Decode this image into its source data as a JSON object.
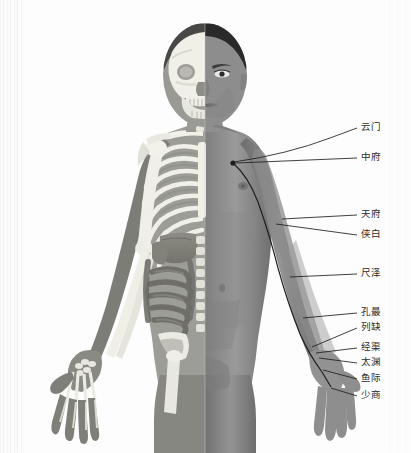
{
  "figure": {
    "width": 411,
    "height": 453,
    "background_color": "#fdfdfd",
    "line_color": "#1f1f1f",
    "label_color": "#2b2b2b",
    "skin_color": "#8e8e8e",
    "bone_color": "#f0efe9"
  },
  "meridian": {
    "name": "手太阴肺经",
    "point_count": 11
  },
  "acupoints": [
    {
      "id": "LU2",
      "label": "云门",
      "code": "LU-2",
      "label_x": 362,
      "label_y": 126,
      "anchor_x": 233,
      "anchor_y": 163,
      "leader": "curve"
    },
    {
      "id": "LU1",
      "label": "中府",
      "code": "LU-1",
      "label_x": 362,
      "label_y": 156,
      "anchor_x": 233,
      "anchor_y": 163,
      "leader": "straight"
    },
    {
      "id": "LU3",
      "label": "天府",
      "code": "LU-3",
      "label_x": 362,
      "label_y": 213,
      "anchor_x": 282,
      "anchor_y": 219,
      "leader": "straight"
    },
    {
      "id": "LU4",
      "label": "侠白",
      "code": "LU-4",
      "label_x": 362,
      "label_y": 233,
      "anchor_x": 279,
      "anchor_y": 228,
      "leader": "straight"
    },
    {
      "id": "LU5",
      "label": "尺泽",
      "code": "LU-5",
      "label_x": 362,
      "label_y": 272,
      "anchor_x": 292,
      "anchor_y": 277,
      "leader": "straight"
    },
    {
      "id": "LU6",
      "label": "孔最",
      "code": "LU-6",
      "label_x": 362,
      "label_y": 311,
      "anchor_x": 305,
      "anchor_y": 318,
      "leader": "straight"
    },
    {
      "id": "LU7",
      "label": "列缺",
      "code": "LU-7",
      "label_x": 362,
      "label_y": 326,
      "anchor_x": 314,
      "anchor_y": 348,
      "leader": "straight"
    },
    {
      "id": "LU8",
      "label": "经渠",
      "code": "LU-8",
      "label_x": 362,
      "label_y": 346,
      "anchor_x": 317,
      "anchor_y": 353,
      "leader": "straight"
    },
    {
      "id": "LU9",
      "label": "太渊",
      "code": "LU-9",
      "label_x": 362,
      "label_y": 361,
      "anchor_x": 320,
      "anchor_y": 358,
      "leader": "straight"
    },
    {
      "id": "LU10",
      "label": "鱼际",
      "code": "LU-10",
      "label_x": 362,
      "label_y": 377,
      "anchor_x": 324,
      "anchor_y": 370,
      "leader": "straight"
    },
    {
      "id": "LU11",
      "label": "少商",
      "code": "LU-11",
      "label_x": 362,
      "label_y": 394,
      "anchor_x": 330,
      "anchor_y": 388,
      "leader": "straight"
    }
  ]
}
